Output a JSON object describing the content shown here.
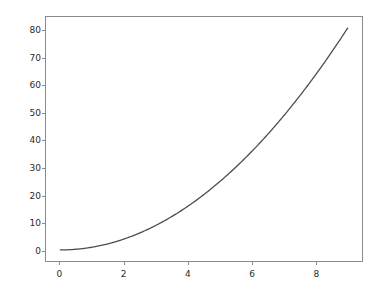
{
  "chart_data": {
    "type": "line",
    "title": "",
    "xlabel": "",
    "ylabel": "",
    "xlim": [
      -0.45,
      9.45
    ],
    "ylim": [
      -4.05,
      85.05
    ],
    "grid": false,
    "legend": null,
    "line_color": "#4c4c55",
    "line_width": 1.3,
    "x": [
      0,
      0.5,
      1,
      1.5,
      2,
      2.5,
      3,
      3.5,
      4,
      4.5,
      5,
      5.5,
      6,
      6.5,
      7,
      7.5,
      8,
      8.5,
      9
    ],
    "y": [
      0,
      0.25,
      1,
      2.25,
      4,
      6.25,
      9,
      12.25,
      16,
      20.25,
      25,
      30.25,
      36,
      42.25,
      49,
      56.25,
      64,
      72.25,
      81
    ],
    "series": [
      {
        "name": "y = x^2",
        "x": [
          0,
          0.5,
          1,
          1.5,
          2,
          2.5,
          3,
          3.5,
          4,
          4.5,
          5,
          5.5,
          6,
          6.5,
          7,
          7.5,
          8,
          8.5,
          9
        ],
        "values": [
          0,
          0.25,
          1,
          2.25,
          4,
          6.25,
          9,
          12.25,
          16,
          20.25,
          25,
          30.25,
          36,
          42.25,
          49,
          56.25,
          64,
          72.25,
          81
        ]
      }
    ],
    "xticks": [
      {
        "value": 0,
        "label": "0"
      },
      {
        "value": 2,
        "label": "2"
      },
      {
        "value": 4,
        "label": "4"
      },
      {
        "value": 6,
        "label": "6"
      },
      {
        "value": 8,
        "label": "8"
      }
    ],
    "yticks": [
      {
        "value": 0,
        "label": "0"
      },
      {
        "value": 10,
        "label": "10"
      },
      {
        "value": 20,
        "label": "20"
      },
      {
        "value": 30,
        "label": "30"
      },
      {
        "value": 40,
        "label": "40"
      },
      {
        "value": 50,
        "label": "50"
      },
      {
        "value": 60,
        "label": "60"
      },
      {
        "value": 70,
        "label": "70"
      },
      {
        "value": 80,
        "label": "80"
      }
    ]
  },
  "figure": {
    "background_color": "#ffffff",
    "axes_frame_color": "#8a8a8a",
    "tick_label_color": "#2b2b2b"
  }
}
